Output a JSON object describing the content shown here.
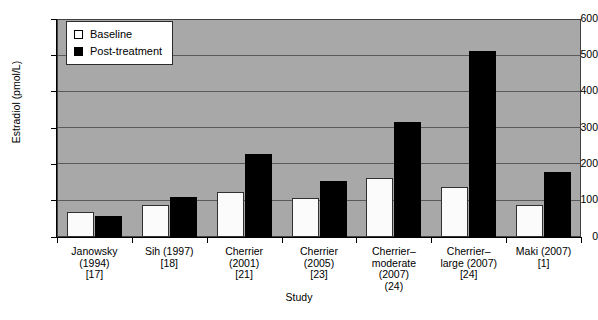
{
  "chart_data": {
    "type": "bar",
    "title": "",
    "xlabel": "Study",
    "ylabel": "Estradiol (pmol/L)",
    "ylim": [
      0,
      600
    ],
    "yticks": [
      0,
      100,
      200,
      300,
      400,
      500,
      600
    ],
    "grid": true,
    "legend_position": "top-left",
    "categories": [
      "Janowsky\n(1994)\n[17]",
      "Sih (1997)\n[18]",
      "Cherrier\n(2001)\n[21]",
      "Cherrier\n(2005)\n[23]",
      "Cherrier–\nmoderate\n(2007)\n(24)",
      "Cherrier–\nlarge (2007)\n[24]",
      "Maki (2007)\n[1]"
    ],
    "category_lines": [
      [
        "Janowsky",
        "(1994)",
        "[17]"
      ],
      [
        "Sih (1997)",
        "[18]"
      ],
      [
        "Cherrier",
        "(2001)",
        "[21]"
      ],
      [
        "Cherrier",
        "(2005)",
        "[23]"
      ],
      [
        "Cherrier–",
        "moderate",
        "(2007)",
        "(24)"
      ],
      [
        "Cherrier–",
        "large (2007)",
        "[24]"
      ],
      [
        "Maki (2007)",
        "[1]"
      ]
    ],
    "series": [
      {
        "name": "Baseline",
        "color": "#ffffff",
        "values": [
          70,
          88,
          125,
          108,
          163,
          138,
          88
        ]
      },
      {
        "name": "Post-treatment",
        "color": "#000000",
        "values": [
          58,
          110,
          228,
          155,
          317,
          512,
          178
        ]
      }
    ]
  },
  "legend": {
    "items": [
      {
        "label": "Baseline",
        "swatch": "open-square"
      },
      {
        "label": "Post-treatment",
        "swatch": "filled-square"
      }
    ]
  },
  "colors": {
    "plot_background": "#a8a8a8",
    "gridline": "#5a5a5a",
    "axis": "#000000",
    "baseline_bar": "#fbfbfb",
    "post_bar": "#000000",
    "page_background": "#ffffff"
  }
}
